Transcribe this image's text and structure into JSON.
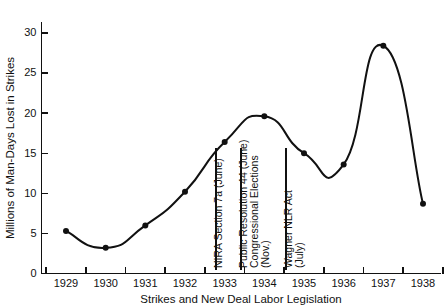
{
  "chart_data": {
    "type": "line",
    "title": "",
    "xlabel": "Strikes and New Deal Labor Legislation",
    "ylabel": "Millions of Man-Days Lost in Strikes",
    "categories": [
      "1929",
      "1930",
      "1931",
      "1932",
      "1933",
      "1934",
      "1935",
      "1936",
      "1937",
      "1938"
    ],
    "x": [
      1929,
      1930,
      1931,
      1932,
      1933,
      1934,
      1935,
      1936,
      1937,
      1938
    ],
    "values": [
      5.3,
      3.2,
      6.0,
      10.2,
      16.4,
      19.6,
      15.0,
      13.6,
      28.4,
      8.7
    ],
    "series": [
      {
        "name": "Millions of Man-Days Lost in Strikes",
        "values": [
          5.3,
          3.2,
          6.0,
          10.2,
          16.4,
          19.6,
          15.0,
          13.6,
          28.4,
          8.7
        ]
      }
    ],
    "ylim": [
      0,
      32
    ],
    "yticks": [
      0,
      5,
      10,
      15,
      20,
      25,
      30
    ],
    "ytick_labels": [
      "0",
      "5",
      "10",
      "15",
      "20",
      "25",
      "30"
    ],
    "xtick_labels": [
      "1929",
      "1930",
      "1931",
      "1932",
      "1933",
      "1934",
      "1935",
      "1936",
      "1937",
      "1938"
    ],
    "grid": false,
    "legend": null,
    "marker": "filled-circle",
    "line_color": "#111111",
    "marker_color": "#111111",
    "annotations": [
      {
        "id": "nira-section-7a",
        "lines": [
          "NIRA Section 7a (June)"
        ],
        "at_year": 1933,
        "orientation": "vertical"
      },
      {
        "id": "public-resolution-44",
        "lines": [
          "Public Resolution 44 (June)"
        ],
        "at_year": 1934,
        "orientation": "vertical"
      },
      {
        "id": "congressional-elections",
        "lines": [
          "Congressional Elections",
          "(Nov.)"
        ],
        "at_year": 1934,
        "orientation": "vertical"
      },
      {
        "id": "wagner-nlr-act",
        "lines": [
          "Wagner NLR Act",
          "(July)"
        ],
        "at_year": 1935,
        "orientation": "vertical"
      }
    ]
  }
}
